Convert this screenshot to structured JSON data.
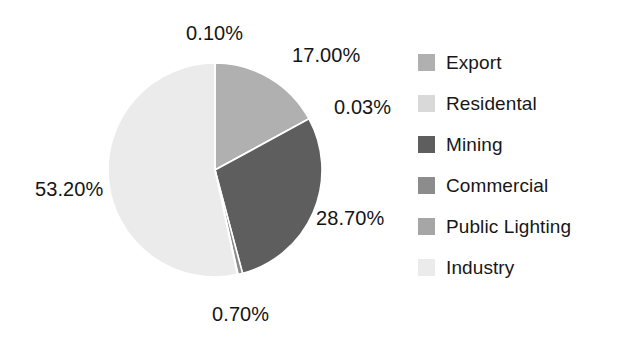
{
  "chart_data": {
    "type": "pie",
    "title": "",
    "categories": [
      "Export",
      "Residental",
      "Mining",
      "Commercial",
      "Public Lighting",
      "Industry"
    ],
    "values": [
      17.0,
      0.03,
      28.7,
      0.7,
      0.1,
      53.2
    ],
    "value_labels": [
      "17.00%",
      "0.03%",
      "28.70%",
      "0.70%",
      "0.10%",
      "53.20%"
    ],
    "unit": "%",
    "legend_position": "right",
    "grid": false,
    "slice_colors": [
      "#b0b0b0",
      "#d9d9d9",
      "#5e5e5e",
      "#8c8c8c",
      "#a6a6a6",
      "#ebebeb"
    ],
    "background_color": "#ffffff",
    "label_color": "#141414",
    "start_angle_deg": 0,
    "direction": "clockwise"
  },
  "legend": {
    "items": [
      {
        "label": "Export",
        "color": "#b0b0b0"
      },
      {
        "label": "Residental",
        "color": "#d9d9d9"
      },
      {
        "label": "Mining",
        "color": "#5e5e5e"
      },
      {
        "label": "Commercial",
        "color": "#8c8c8c"
      },
      {
        "label": "Public Lighting",
        "color": "#a6a6a6"
      },
      {
        "label": "Industry",
        "color": "#ebebeb"
      }
    ]
  },
  "data_labels": {
    "industry": "53.20%",
    "public_lighting": "0.10%",
    "export": "17.00%",
    "residental": "0.03%",
    "mining": "28.70%",
    "commercial": "0.70%"
  }
}
